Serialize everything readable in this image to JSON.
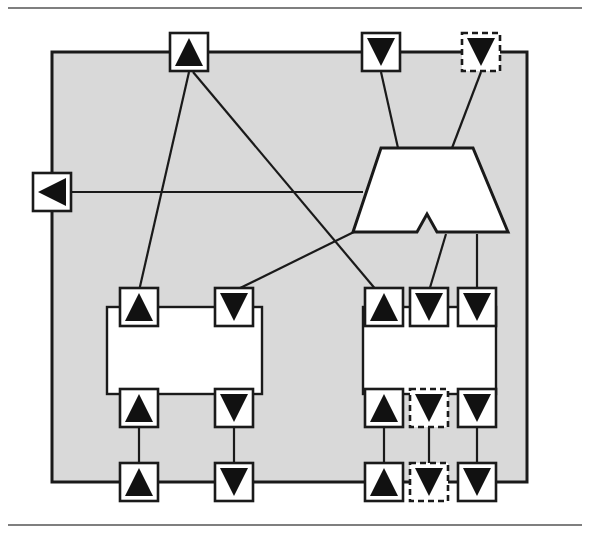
{
  "diagram": {
    "type": "component-port-connection-diagram",
    "outer_component": {
      "name": "outer-component",
      "label": "Tuner",
      "fill": "#d9d9d9",
      "stroke": "#1a1a1a",
      "x": 52,
      "y": 52,
      "width": 475,
      "height": 430,
      "label_x": 70,
      "label_y": 90
    },
    "inner_components": [
      {
        "name": "simple-tuner",
        "label_line1": "Simple",
        "label_line2": "Tuner",
        "fill": "#ffffff",
        "stroke": "#1a1a1a",
        "x": 107,
        "y": 307,
        "width": 155,
        "height": 87,
        "label_cx": 184,
        "label_y1": 348,
        "label_y2": 374
      },
      {
        "name": "searching-tuner",
        "label_line1": "Searching",
        "label_line2": "Tuner",
        "fill": "#ffffff",
        "stroke": "#1a1a1a",
        "x": 363,
        "y": 307,
        "width": 133,
        "height": 87,
        "label_cx": 429,
        "label_y1": 348,
        "label_y2": 374
      }
    ],
    "special_shape": {
      "name": "connector-trapezoid",
      "fill": "#ffffff",
      "stroke": "#1a1a1a",
      "points": "381,148 473,148 508,232 437,232 427,214 417,232 353,232"
    },
    "ports": [
      {
        "name": "port-outer-top-left-provided",
        "glyph": "triangle-up",
        "style": "solid",
        "cx": 189,
        "cy": 52,
        "size": 38
      },
      {
        "name": "port-outer-top-mid-required",
        "glyph": "triangle-down",
        "style": "solid",
        "cx": 381,
        "cy": 52,
        "size": 38
      },
      {
        "name": "port-outer-top-right-required-optional",
        "glyph": "triangle-down",
        "style": "dashed",
        "cx": 481,
        "cy": 52,
        "size": 38
      },
      {
        "name": "port-outer-left-provided",
        "glyph": "triangle-left",
        "style": "solid",
        "cx": 52,
        "cy": 192,
        "size": 38
      },
      {
        "name": "port-simple-tuner-top-left-provided",
        "glyph": "triangle-up",
        "style": "solid",
        "cx": 139,
        "cy": 307,
        "size": 38
      },
      {
        "name": "port-simple-tuner-top-right-required",
        "glyph": "triangle-down",
        "style": "solid",
        "cx": 234,
        "cy": 307,
        "size": 38
      },
      {
        "name": "port-simple-tuner-bottom-left-provided",
        "glyph": "triangle-up",
        "style": "solid",
        "cx": 139,
        "cy": 408,
        "size": 38
      },
      {
        "name": "port-simple-tuner-bottom-right-required",
        "glyph": "triangle-down",
        "style": "solid",
        "cx": 234,
        "cy": 408,
        "size": 38
      },
      {
        "name": "port-searching-tuner-top-left-provided",
        "glyph": "triangle-up",
        "style": "solid",
        "cx": 384,
        "cy": 307,
        "size": 38
      },
      {
        "name": "port-searching-tuner-top-mid-required",
        "glyph": "triangle-down",
        "style": "solid",
        "cx": 429,
        "cy": 307,
        "size": 38
      },
      {
        "name": "port-searching-tuner-top-right-required",
        "glyph": "triangle-down",
        "style": "solid",
        "cx": 477,
        "cy": 307,
        "size": 38
      },
      {
        "name": "port-searching-tuner-bottom-left-provided",
        "glyph": "triangle-up",
        "style": "solid",
        "cx": 384,
        "cy": 408,
        "size": 38
      },
      {
        "name": "port-searching-tuner-bottom-mid-required-optional",
        "glyph": "triangle-down",
        "style": "dashed",
        "cx": 429,
        "cy": 408,
        "size": 38
      },
      {
        "name": "port-searching-tuner-bottom-right-required",
        "glyph": "triangle-down",
        "style": "solid",
        "cx": 477,
        "cy": 408,
        "size": 38
      },
      {
        "name": "port-outer-bottom-simple-provided",
        "glyph": "triangle-up",
        "style": "solid",
        "cx": 139,
        "cy": 482,
        "size": 38
      },
      {
        "name": "port-outer-bottom-simple-required",
        "glyph": "triangle-down",
        "style": "solid",
        "cx": 234,
        "cy": 482,
        "size": 38
      },
      {
        "name": "port-outer-bottom-searching-provided",
        "glyph": "triangle-up",
        "style": "solid",
        "cx": 384,
        "cy": 482,
        "size": 38
      },
      {
        "name": "port-outer-bottom-searching-required-optional",
        "glyph": "triangle-down",
        "style": "dashed",
        "cx": 429,
        "cy": 482,
        "size": 38
      },
      {
        "name": "port-outer-bottom-searching-required",
        "glyph": "triangle-down",
        "style": "solid",
        "cx": 477,
        "cy": 482,
        "size": 38
      }
    ],
    "connections": [
      {
        "name": "conn-top-left-to-simple-top-left",
        "d": "M 189 72 L 139 291"
      },
      {
        "name": "conn-top-left-to-searching-top-left",
        "d": "M 193 72 L 377 291"
      },
      {
        "name": "conn-top-mid-to-trapezoid",
        "d": "M 381 72 L 398 148"
      },
      {
        "name": "conn-top-right-dashed-to-trapezoid",
        "d": "M 481 72 L 452 148"
      },
      {
        "name": "conn-left-port-horizontal",
        "d": "M 52 192 L 363 192"
      },
      {
        "name": "conn-trapezoid-left-to-simple-top-right",
        "d": "M 362 228 L 234 291"
      },
      {
        "name": "conn-trapezoid-to-searching-top-mid",
        "d": "M 446 234 L 429 291"
      },
      {
        "name": "conn-trapezoid-to-searching-top-right",
        "d": "M 477 234 L 477 291"
      },
      {
        "name": "conn-simple-left-vertical",
        "d": "M 139 424 L 139 463"
      },
      {
        "name": "conn-simple-right-vertical",
        "d": "M 234 424 L 234 463"
      },
      {
        "name": "conn-searching-left-vertical",
        "d": "M 384 424 L 384 463"
      },
      {
        "name": "conn-searching-mid-vertical",
        "d": "M 429 424 L 429 463"
      },
      {
        "name": "conn-searching-right-vertical",
        "d": "M 477 424 L 477 463"
      }
    ],
    "rules": [
      {
        "name": "top-horizontal-rule",
        "x1": 8,
        "y1": 8,
        "x2": 582,
        "y2": 8
      },
      {
        "name": "bottom-horizontal-rule",
        "x1": 8,
        "y1": 525,
        "x2": 582,
        "y2": 525
      }
    ]
  }
}
